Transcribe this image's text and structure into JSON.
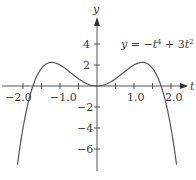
{
  "chart_data": {
    "type": "line",
    "title": "",
    "equation": "y = −t⁴ + 3t²",
    "xlabel": "t",
    "ylabel": "y",
    "xlim": [
      -2.15,
      2.15
    ],
    "ylim": [
      -8,
      5
    ],
    "x_tick_labels": [
      "−2.0",
      "−1.0",
      "1.0",
      "2.0"
    ],
    "x_tick_label_values": [
      -2.0,
      -1.0,
      1.0,
      2.0
    ],
    "x_minor_ticks": [
      -2.0,
      -1.5,
      -1.0,
      -0.5,
      0.5,
      1.0,
      1.5,
      2.0
    ],
    "y_tick_labels": [
      "4",
      "2",
      "−2",
      "−4",
      "−6"
    ],
    "y_tick_values": [
      4,
      2,
      -2,
      -4,
      -6
    ],
    "grid": false,
    "legend": "none",
    "series": [
      {
        "name": "y = −t⁴ + 3t²",
        "x": [
          -2.15,
          -2.0,
          -1.732,
          -1.5,
          -1.2247,
          -1.0,
          -0.5,
          0,
          0.5,
          1.0,
          1.2247,
          1.5,
          1.732,
          2.0,
          2.15
        ],
        "y": [
          -7.5,
          -4.0,
          0.0,
          1.69,
          2.25,
          2.0,
          0.69,
          0.0,
          0.69,
          2.0,
          2.25,
          1.69,
          0.0,
          -4.0,
          -7.5
        ]
      }
    ]
  },
  "labels": {
    "x_axis": "t",
    "y_axis": "y",
    "eq_y": "y",
    "eq_eq": " = −",
    "eq_t1": "t",
    "eq_p4": "4",
    "eq_plus": " + 3",
    "eq_t2": "t",
    "eq_p2": "2",
    "xt_m2": "−2.0",
    "xt_m1": "−1.0",
    "xt_1": "1.0",
    "xt_2": "2.0",
    "yt_4": "4",
    "yt_2": "2",
    "yt_m2": "−2",
    "yt_m4": "−4",
    "yt_m6": "−6"
  }
}
